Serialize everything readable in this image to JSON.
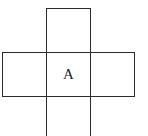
{
  "diagram": {
    "type": "cube-net-cross",
    "line_color": "#2a2a2a",
    "background": "#ffffff",
    "cells": [
      {
        "id": "top",
        "label": ""
      },
      {
        "id": "left",
        "label": ""
      },
      {
        "id": "center",
        "label": "A"
      },
      {
        "id": "right",
        "label": ""
      },
      {
        "id": "bottom",
        "label": ""
      }
    ]
  }
}
